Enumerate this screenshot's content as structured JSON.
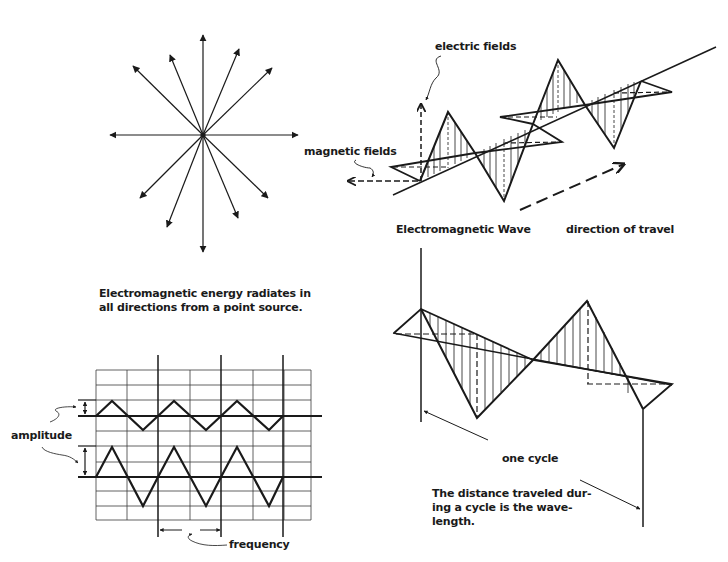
{
  "panels": {
    "point_source": {
      "caption": [
        "Electromagnetic energy radiates in",
        "all directions from a point source."
      ],
      "arrow_count": 12
    },
    "em_wave": {
      "labels": {
        "electric": "electric fields",
        "magnetic": "magnetic fields",
        "title": "Electromagnetic Wave",
        "direction": "direction of travel"
      }
    },
    "amplitude_frequency": {
      "labels": {
        "amplitude": "amplitude",
        "frequency": "frequency"
      },
      "waves": [
        {
          "name": "small-amplitude-wave",
          "cycles": 3
        },
        {
          "name": "large-amplitude-wave",
          "cycles": 3
        }
      ]
    },
    "wavelength": {
      "labels": {
        "cycle": "one cycle",
        "definition": [
          "The distance traveled dur-",
          "ing a cycle is the wave-",
          "length."
        ]
      }
    }
  },
  "colors": {
    "ink": "#1a1a1a",
    "background": "#ffffff",
    "grid": "#3a3a3a"
  }
}
